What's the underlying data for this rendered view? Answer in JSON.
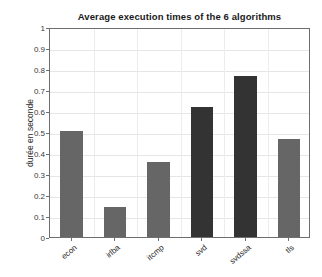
{
  "chart_data": {
    "type": "bar",
    "title": "Average execution times of the 6 algorithms",
    "xlabel": "",
    "ylabel": "durée en seconde",
    "categories": [
      "econ",
      "irlba",
      "itcmp",
      "svd",
      "svdssa",
      "tls"
    ],
    "values": [
      0.505,
      0.143,
      0.357,
      0.62,
      0.765,
      0.467
    ],
    "bar_colors": [
      "#666666",
      "#666666",
      "#666666",
      "#333333",
      "#333333",
      "#666666"
    ],
    "ylim": [
      0,
      1
    ],
    "yticks": [
      0,
      0.1,
      0.2,
      0.3,
      0.4,
      0.5,
      0.6,
      0.7,
      0.8,
      0.9,
      1
    ],
    "ytick_labels": [
      "0",
      "0.1",
      "0.2",
      "0.3",
      "0.4",
      "0.5",
      "0.6",
      "0.7",
      "0.8",
      "0.9",
      "1"
    ],
    "grid": true,
    "grid_color": "#e6e6e6",
    "legend": null,
    "legend_position": "none",
    "axis_color": "#6e6e6e",
    "background": "#ffffff",
    "xtick_label_rotation": -40
  }
}
